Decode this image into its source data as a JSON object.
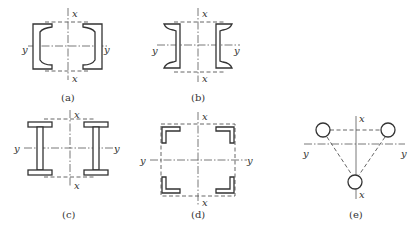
{
  "figure": {
    "panels": [
      {
        "id": "a",
        "label": "(a)",
        "axis_x": "x",
        "axis_y": "y",
        "section": "two channels, flanges facing inward"
      },
      {
        "id": "b",
        "label": "(b)",
        "axis_x": "x",
        "axis_y": "y",
        "section": "two channels, flanges facing outward"
      },
      {
        "id": "c",
        "label": "(c)",
        "axis_x": "x",
        "axis_y": "y",
        "section": "two I-sections"
      },
      {
        "id": "d",
        "label": "(d)",
        "axis_x": "x",
        "axis_y": "y",
        "section": "four angles at corners"
      },
      {
        "id": "e",
        "label": "(e)",
        "axis_x": "x",
        "axis_y": "y",
        "section": "three round tubes in triangular arrangement"
      }
    ]
  },
  "colors": {
    "line": "#333333",
    "background": "#ffffff"
  }
}
